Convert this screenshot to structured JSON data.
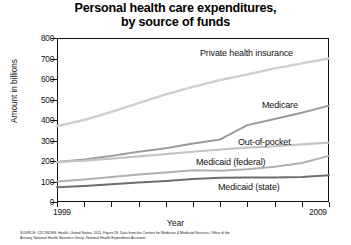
{
  "title": {
    "line1": "Personal health care expenditures,",
    "line2": "by source of funds"
  },
  "axes": {
    "ylabel": "Amount in billions",
    "xlabel": "Year",
    "yticks": [
      "800",
      "700",
      "600",
      "500",
      "400",
      "300",
      "200",
      "100",
      "0"
    ],
    "xticks_labeled": [
      "1999",
      "2009"
    ]
  },
  "series_labels": {
    "private": "Private health insurance",
    "medicare": "Medicare",
    "oop": "Out-of-pocket",
    "medicaid_federal": "Medicaid (federal)",
    "medicaid_state": "Medicaid (state)"
  },
  "footer": {
    "line1": "SOURCE: CDC/NCHS, Health, United States, 2011, Figure 28. Data from the Centers for Medicare & Medicaid Services, Office of the",
    "line2": "Actuary, National Health Statistics Group, National Health Expenditure Accounts."
  },
  "colors": {
    "private": "#cfcfcf",
    "medicare": "#9a9a9a",
    "oop": "#c4c4c4",
    "medicaid_federal": "#b0b0b0",
    "medicaid_state": "#6f6f6f",
    "axis": "#111111"
  },
  "chart_data": {
    "type": "line",
    "title": "Personal health care expenditures, by source of funds",
    "xlabel": "Year",
    "ylabel": "Amount in billions",
    "xlim": [
      1999,
      2009
    ],
    "ylim": [
      0,
      800
    ],
    "ytick_step": 100,
    "grid": false,
    "legend": "inline-labels",
    "x": [
      1999,
      2000,
      2001,
      2002,
      2003,
      2004,
      2005,
      2006,
      2007,
      2008,
      2009
    ],
    "series": [
      {
        "name": "Private health insurance",
        "values": [
          370,
          400,
          440,
          482,
          525,
          562,
          595,
          622,
          652,
          676,
          700
        ]
      },
      {
        "name": "Medicare",
        "values": [
          195,
          207,
          225,
          245,
          262,
          285,
          305,
          375,
          405,
          435,
          470
        ]
      },
      {
        "name": "Out-of-pocket",
        "values": [
          195,
          202,
          212,
          223,
          234,
          245,
          256,
          265,
          272,
          281,
          290
        ]
      },
      {
        "name": "Medicaid (federal)",
        "values": [
          100,
          110,
          122,
          134,
          144,
          155,
          152,
          160,
          172,
          190,
          225
        ]
      },
      {
        "name": "Medicaid (state)",
        "values": [
          72,
          78,
          86,
          95,
          103,
          112,
          118,
          120,
          120,
          122,
          130
        ]
      }
    ]
  }
}
